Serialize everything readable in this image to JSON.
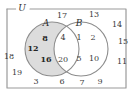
{
  "figure": {
    "type": "venn-diagram",
    "universe_label": "U",
    "set_a_label": "A",
    "set_b_label": "B"
  },
  "colors": {
    "shading": "#dcdcdc",
    "outline": "#808080",
    "frame": "#9a9a9a",
    "text": "#3a3a3a",
    "background": "#ffffff"
  },
  "regions": {
    "a_only": {
      "name": "A only (shaded)",
      "shaded": true,
      "elements": [
        "12",
        "8",
        "16"
      ]
    },
    "intersection": {
      "name": "A and B",
      "shaded": false,
      "elements": [
        "4",
        "20"
      ]
    },
    "b_only": {
      "name": "B only",
      "shaded": false,
      "elements": [
        "1",
        "2",
        "5",
        "10"
      ]
    },
    "outside": {
      "name": "Outside A and B",
      "shaded": false,
      "elements": [
        "17",
        "13",
        "14",
        "15",
        "11",
        "9",
        "7",
        "6",
        "3",
        "19",
        "18"
      ]
    }
  },
  "placed_labels": [
    {
      "text": "U",
      "x": 22,
      "y": 8,
      "kind": "universe"
    },
    {
      "text": "A",
      "x": 46,
      "y": 23,
      "kind": "set-name"
    },
    {
      "text": "B",
      "x": 79,
      "y": 23,
      "kind": "set-name"
    },
    {
      "text": "17",
      "x": 62,
      "y": 16,
      "kind": "plain"
    },
    {
      "text": "13",
      "x": 94,
      "y": 15,
      "kind": "plain"
    },
    {
      "text": "14",
      "x": 117,
      "y": 25,
      "kind": "plain"
    },
    {
      "text": "15",
      "x": 123,
      "y": 42,
      "kind": "plain"
    },
    {
      "text": "11",
      "x": 122,
      "y": 62,
      "kind": "plain"
    },
    {
      "text": "18",
      "x": 9,
      "y": 57,
      "kind": "plain"
    },
    {
      "text": "19",
      "x": 17,
      "y": 73,
      "kind": "plain"
    },
    {
      "text": "3",
      "x": 36,
      "y": 82,
      "kind": "plain"
    },
    {
      "text": "6",
      "x": 62,
      "y": 82,
      "kind": "plain"
    },
    {
      "text": "7",
      "x": 82,
      "y": 83,
      "kind": "plain"
    },
    {
      "text": "9",
      "x": 100,
      "y": 82,
      "kind": "plain"
    },
    {
      "text": "12",
      "x": 33,
      "y": 48,
      "kind": "shaded-el"
    },
    {
      "text": "8",
      "x": 45,
      "y": 38,
      "kind": "shaded-el"
    },
    {
      "text": "16",
      "x": 46,
      "y": 59,
      "kind": "shaded-el"
    },
    {
      "text": "4",
      "x": 63,
      "y": 38,
      "kind": "plain"
    },
    {
      "text": "20",
      "x": 63,
      "y": 60,
      "kind": "plain"
    },
    {
      "text": "1",
      "x": 79,
      "y": 38,
      "kind": "plain"
    },
    {
      "text": "2",
      "x": 93,
      "y": 38,
      "kind": "plain"
    },
    {
      "text": "5",
      "x": 79,
      "y": 59,
      "kind": "plain"
    },
    {
      "text": "10",
      "x": 94,
      "y": 59,
      "kind": "plain"
    }
  ]
}
